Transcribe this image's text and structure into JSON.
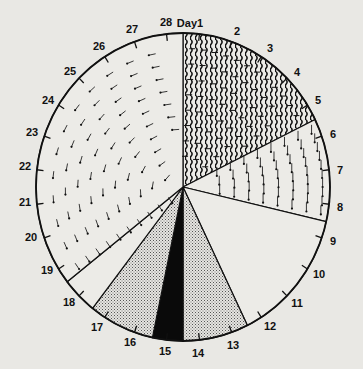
{
  "diagram": {
    "type": "cycle-wheel",
    "center": [
      183,
      187
    ],
    "radius_x": 147,
    "radius_y": 154,
    "colors": {
      "background": "#e9e8e4",
      "ink": "#111111",
      "paper": "#ecebe7"
    },
    "day_labels": [
      {
        "text": "Day1",
        "x": 190,
        "y": 27
      },
      {
        "text": "2",
        "x": 237,
        "y": 35
      },
      {
        "text": "3",
        "x": 270,
        "y": 52
      },
      {
        "text": "4",
        "x": 297,
        "y": 76
      },
      {
        "text": "5",
        "x": 318,
        "y": 104
      },
      {
        "text": "6",
        "x": 333,
        "y": 138
      },
      {
        "text": "7",
        "x": 340,
        "y": 174
      },
      {
        "text": "8",
        "x": 340,
        "y": 211
      },
      {
        "text": "9",
        "x": 333,
        "y": 245
      },
      {
        "text": "10",
        "x": 319,
        "y": 278
      },
      {
        "text": "11",
        "x": 297,
        "y": 307
      },
      {
        "text": "12",
        "x": 270,
        "y": 330
      },
      {
        "text": "13",
        "x": 233,
        "y": 349
      },
      {
        "text": "14",
        "x": 198,
        "y": 357
      },
      {
        "text": "15",
        "x": 165,
        "y": 355
      },
      {
        "text": "16",
        "x": 130,
        "y": 346
      },
      {
        "text": "17",
        "x": 97,
        "y": 331
      },
      {
        "text": "18",
        "x": 69,
        "y": 306
      },
      {
        "text": "19",
        "x": 47,
        "y": 274
      },
      {
        "text": "20",
        "x": 31,
        "y": 241
      },
      {
        "text": "21",
        "x": 25,
        "y": 206
      },
      {
        "text": "22",
        "x": 25,
        "y": 170
      },
      {
        "text": "23",
        "x": 32,
        "y": 136
      },
      {
        "text": "24",
        "x": 48,
        "y": 104
      },
      {
        "text": "25",
        "x": 70,
        "y": 75
      },
      {
        "text": "26",
        "x": 99,
        "y": 50
      },
      {
        "text": "27",
        "x": 132,
        "y": 33
      },
      {
        "text": "28",
        "x": 166,
        "y": 26
      }
    ],
    "segments": [
      {
        "name": "segment-days-1-5-wavy",
        "start_deg": 0,
        "end_deg": 64,
        "pattern": "wavy"
      },
      {
        "name": "segment-days-6-8-down-arrows",
        "start_deg": 64,
        "end_deg": 103,
        "pattern": "down-arrows"
      },
      {
        "name": "segment-days-9-12-blank",
        "start_deg": 103,
        "end_deg": 154,
        "pattern": "blank"
      },
      {
        "name": "segment-days-12-14-stipple",
        "start_deg": 154,
        "end_deg": 180,
        "pattern": "stipple"
      },
      {
        "name": "segment-day-15-black",
        "start_deg": 180,
        "end_deg": 192,
        "pattern": "solid"
      },
      {
        "name": "segment-days-15-17-stipple",
        "start_deg": 192,
        "end_deg": 218,
        "pattern": "stipple"
      },
      {
        "name": "segment-days-18-19-blank",
        "start_deg": 218,
        "end_deg": 232,
        "pattern": "blank"
      },
      {
        "name": "segment-days-19-28-swirl-arrows",
        "start_deg": 232,
        "end_deg": 360,
        "pattern": "swirl-arrows"
      }
    ]
  }
}
